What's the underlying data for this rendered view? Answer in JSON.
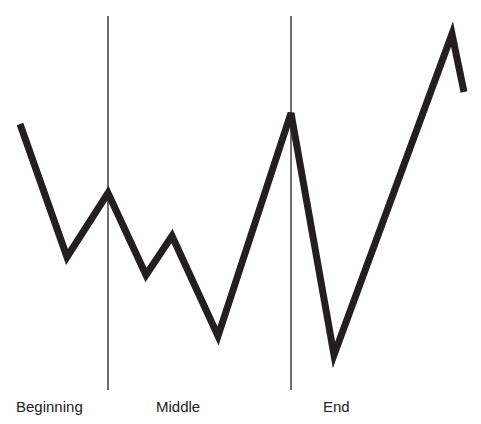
{
  "diagram": {
    "type": "line-story-arc",
    "labels": {
      "beginning": "Beginning",
      "middle": "Middle",
      "end": "End"
    },
    "colors": {
      "line": "#231f20",
      "divider": "#231f20",
      "background": "#ffffff"
    },
    "dividers": [
      {
        "x": 108,
        "y1": 16,
        "y2": 390
      },
      {
        "x": 291,
        "y1": 16,
        "y2": 390
      }
    ],
    "points": [
      [
        20,
        124
      ],
      [
        67,
        257
      ],
      [
        108,
        193
      ],
      [
        146,
        275
      ],
      [
        172,
        236
      ],
      [
        218,
        336
      ],
      [
        291,
        113
      ],
      [
        334,
        355
      ],
      [
        452,
        34
      ],
      [
        464,
        92
      ]
    ]
  },
  "chart_data": {
    "type": "line",
    "title": "",
    "xlabel": "",
    "ylabel": "",
    "sections": [
      "Beginning",
      "Middle",
      "End"
    ],
    "x": [
      20,
      67,
      108,
      146,
      172,
      218,
      291,
      334,
      452,
      464
    ],
    "values": [
      300,
      167,
      231,
      149,
      188,
      88,
      311,
      69,
      390,
      332
    ],
    "grid": false,
    "legend": null
  }
}
